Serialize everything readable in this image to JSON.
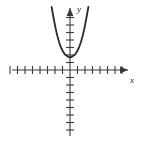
{
  "figure": {
    "background_color": "#ffffff",
    "line_color": "#2b2b2b",
    "axis_color": "#3a3a3a",
    "x_axis_label": "x",
    "y_axis_label": "y"
  },
  "chart_data": {
    "type": "line",
    "title": "",
    "subtitle": "",
    "xlabel": "x",
    "ylabel": "y",
    "grid": false,
    "legend": null,
    "axes": {
      "origin_px": [
        70,
        70
      ],
      "tick_spacing_px": 7.5,
      "x_ticks_left": 8,
      "x_ticks_right": 8,
      "y_ticks_up": 8,
      "y_ticks_down": 8,
      "x_arrow": "right",
      "y_arrow": "up",
      "tick_labels": [],
      "xlim": [
        -8.5,
        9.5
      ],
      "ylim": [
        -9,
        8.5
      ]
    },
    "series": [
      {
        "name": "parabola",
        "equation": "y = a*x^2 + 1.7",
        "vertex": [
          0,
          1.7
        ],
        "opens": "up",
        "x": [
          -2.45,
          -2.2,
          -1.95,
          -1.7,
          -1.45,
          -1.2,
          -0.95,
          -0.7,
          -0.45,
          -0.2,
          0,
          0.2,
          0.45,
          0.7,
          0.95,
          1.2,
          1.45,
          1.7,
          1.95,
          2.2,
          2.45
        ],
        "values": [
          8.4,
          7.0,
          5.7,
          4.6,
          3.7,
          3.0,
          2.5,
          2.1,
          1.9,
          1.72,
          1.7,
          1.72,
          1.9,
          2.1,
          2.5,
          3.0,
          3.7,
          4.6,
          5.7,
          7.0,
          8.4
        ]
      }
    ]
  }
}
